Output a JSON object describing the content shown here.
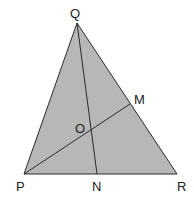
{
  "diagram": {
    "type": "triangle",
    "colors": {
      "fill": "#b7b7b7",
      "stroke": "#2a2a2a",
      "label": "#222222",
      "background": "#ffffff"
    },
    "points": {
      "Q": {
        "label": "Q",
        "x": 77,
        "y": 23,
        "label_x": 70,
        "label_y": 18
      },
      "P": {
        "label": "P",
        "x": 24,
        "y": 174,
        "label_x": 16,
        "label_y": 191
      },
      "R": {
        "label": "R",
        "x": 177,
        "y": 174,
        "label_x": 177,
        "label_y": 191
      },
      "N": {
        "label": "N",
        "x": 97,
        "y": 174,
        "label_x": 92,
        "label_y": 191
      },
      "M": {
        "label": "M",
        "x": 130,
        "y": 104,
        "label_x": 134,
        "label_y": 104
      },
      "O": {
        "label": "O",
        "x": 91,
        "y": 131,
        "label_x": 75,
        "label_y": 133
      }
    },
    "segments": [
      {
        "from": "P",
        "to": "Q"
      },
      {
        "from": "Q",
        "to": "R"
      },
      {
        "from": "P",
        "to": "R"
      },
      {
        "from": "Q",
        "to": "N"
      },
      {
        "from": "P",
        "to": "M"
      }
    ]
  }
}
